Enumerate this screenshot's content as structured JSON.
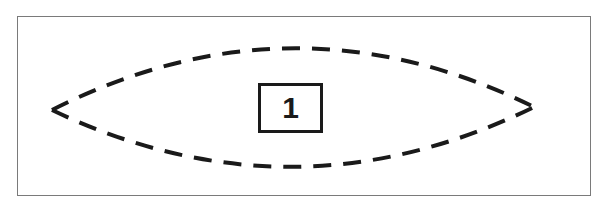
{
  "diagram": {
    "shape": "lens (vesica) outline, dashed",
    "label": "1",
    "colors": {
      "stroke": "#1a1a1a",
      "frame": "#7a7a7a",
      "background": "#ffffff"
    }
  }
}
